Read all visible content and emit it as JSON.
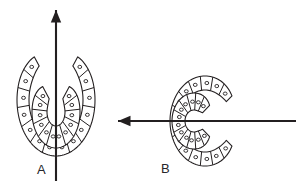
{
  "figure": {
    "background_color": "#ffffff",
    "stroke_color": "#231f20",
    "fill_color": "#ffffff",
    "axis_color": "#231f20"
  },
  "panels": [
    {
      "id": "A",
      "label": "A",
      "label_x": 37,
      "label_y": 163,
      "description": "Horseshoe opening downward; vertical symmetry axis with arrowhead pointing up",
      "center_x": 56,
      "center_y": 100,
      "axis": {
        "name": "vertical-axis",
        "orientation": "vertical",
        "arrow_direction": "up",
        "x1": 56,
        "y1": 181,
        "x2": 56,
        "y2": 10,
        "arrowhead_x": 56,
        "arrowhead_y": 10
      },
      "bands": [
        {
          "name": "outer-band",
          "segments": 14,
          "inner_radius_x": 27,
          "inner_radius_y": 40,
          "outer_radius_x": 39,
          "outer_radius_y": 56
        },
        {
          "name": "inner-band",
          "segments": 12,
          "inner_radius_x": 9,
          "inner_radius_y": 14,
          "outer_radius_x": 24,
          "outer_radius_y": 36
        }
      ]
    },
    {
      "id": "B",
      "label": "B",
      "label_x": 161,
      "label_y": 162,
      "description": "Horseshoe opening to the right; horizontal symmetry axis with arrowhead pointing left",
      "center_x": 205,
      "center_y": 121,
      "axis": {
        "name": "horizontal-axis",
        "orientation": "horizontal",
        "arrow_direction": "left",
        "x1": 296,
        "y1": 121,
        "x2": 118,
        "y2": 121,
        "arrowhead_x": 118,
        "arrowhead_y": 121
      },
      "bands": [
        {
          "name": "outer-band",
          "segments": 14,
          "inner_radius_x": 31,
          "inner_radius_y": 25,
          "outer_radius_x": 45,
          "outer_radius_y": 35
        },
        {
          "name": "inner-band",
          "segments": 12,
          "inner_radius_x": 11,
          "inner_radius_y": 9,
          "outer_radius_x": 28,
          "outer_radius_y": 22
        }
      ]
    }
  ],
  "legend": {
    "segment_marker": "nucleus-dot",
    "segment_marker_shape": "small-circle"
  }
}
